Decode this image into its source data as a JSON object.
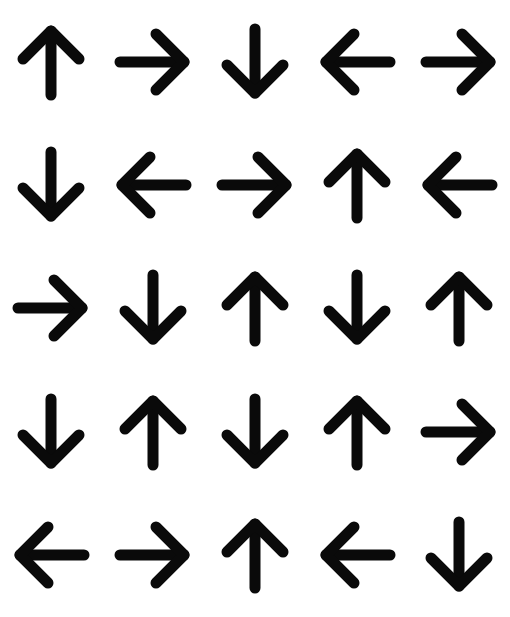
{
  "canvas": {
    "width": 510,
    "height": 617,
    "background_color": "#ffffff",
    "arrow_color": "#0a0a0a"
  },
  "grid": {
    "rows": 5,
    "columns": 5,
    "cell_count": 25
  },
  "arrows": [
    {
      "row": 1,
      "col": 1,
      "direction": "up",
      "glyph": "↑",
      "icon_name": "arrow-up-icon"
    },
    {
      "row": 1,
      "col": 2,
      "direction": "right",
      "glyph": "→",
      "icon_name": "arrow-right-icon"
    },
    {
      "row": 1,
      "col": 3,
      "direction": "down",
      "glyph": "↓",
      "icon_name": "arrow-down-icon"
    },
    {
      "row": 1,
      "col": 4,
      "direction": "left",
      "glyph": "←",
      "icon_name": "arrow-left-icon"
    },
    {
      "row": 1,
      "col": 5,
      "direction": "right",
      "glyph": "→",
      "icon_name": "arrow-right-icon"
    },
    {
      "row": 2,
      "col": 1,
      "direction": "down",
      "glyph": "↓",
      "icon_name": "arrow-down-icon"
    },
    {
      "row": 2,
      "col": 2,
      "direction": "left",
      "glyph": "←",
      "icon_name": "arrow-left-icon"
    },
    {
      "row": 2,
      "col": 3,
      "direction": "right",
      "glyph": "→",
      "icon_name": "arrow-right-icon"
    },
    {
      "row": 2,
      "col": 4,
      "direction": "up",
      "glyph": "↑",
      "icon_name": "arrow-up-icon"
    },
    {
      "row": 2,
      "col": 5,
      "direction": "left",
      "glyph": "←",
      "icon_name": "arrow-left-icon"
    },
    {
      "row": 3,
      "col": 1,
      "direction": "right",
      "glyph": "→",
      "icon_name": "arrow-right-icon"
    },
    {
      "row": 3,
      "col": 2,
      "direction": "down",
      "glyph": "↓",
      "icon_name": "arrow-down-icon"
    },
    {
      "row": 3,
      "col": 3,
      "direction": "up",
      "glyph": "↑",
      "icon_name": "arrow-up-icon"
    },
    {
      "row": 3,
      "col": 4,
      "direction": "down",
      "glyph": "↓",
      "icon_name": "arrow-down-icon"
    },
    {
      "row": 3,
      "col": 5,
      "direction": "up",
      "glyph": "↑",
      "icon_name": "arrow-up-icon"
    },
    {
      "row": 4,
      "col": 1,
      "direction": "down",
      "glyph": "↓",
      "icon_name": "arrow-down-icon"
    },
    {
      "row": 4,
      "col": 2,
      "direction": "up",
      "glyph": "↑",
      "icon_name": "arrow-up-icon"
    },
    {
      "row": 4,
      "col": 3,
      "direction": "down",
      "glyph": "↓",
      "icon_name": "arrow-down-icon"
    },
    {
      "row": 4,
      "col": 4,
      "direction": "up",
      "glyph": "↑",
      "icon_name": "arrow-up-icon"
    },
    {
      "row": 4,
      "col": 5,
      "direction": "right",
      "glyph": "→",
      "icon_name": "arrow-right-icon"
    },
    {
      "row": 5,
      "col": 1,
      "direction": "left",
      "glyph": "←",
      "icon_name": "arrow-left-icon"
    },
    {
      "row": 5,
      "col": 2,
      "direction": "right",
      "glyph": "→",
      "icon_name": "arrow-right-icon"
    },
    {
      "row": 5,
      "col": 3,
      "direction": "up",
      "glyph": "↑",
      "icon_name": "arrow-up-icon"
    },
    {
      "row": 5,
      "col": 4,
      "direction": "left",
      "glyph": "←",
      "icon_name": "arrow-left-icon"
    },
    {
      "row": 5,
      "col": 5,
      "direction": "down",
      "glyph": "↓",
      "icon_name": "arrow-down-icon"
    }
  ]
}
